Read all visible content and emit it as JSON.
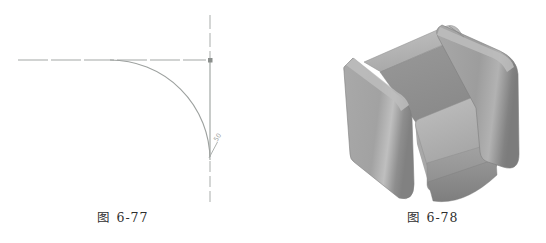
{
  "page": {
    "background_color": "#ffffff"
  },
  "figures": [
    {
      "id": "fig-6-77",
      "caption": "图 6-77",
      "kind": "2d-cad-fillet-line-drawing",
      "annotation_text": "50",
      "line_color": "#a4a8a6",
      "elements": [
        "horizontal-centerline",
        "vertical-centerline",
        "quarter-fillet-arc",
        "leader-with-annotation",
        "intersection-grip-point"
      ]
    },
    {
      "id": "fig-6-78",
      "caption": "图 6-78",
      "kind": "3d-sofa-shaded-render",
      "colors": {
        "top_face": "#bdbdbd",
        "side_light": "#a5a5a5",
        "side_dark": "#8a8a8a",
        "inner_shadow": "#909090",
        "outline": "#707070"
      }
    }
  ]
}
